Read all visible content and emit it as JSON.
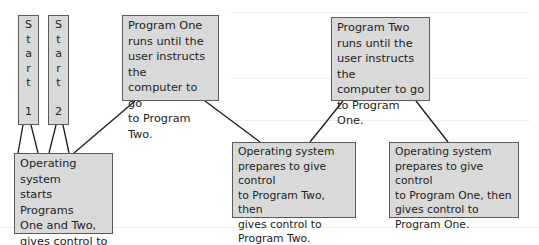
{
  "diagram": {
    "type": "flow",
    "colors": {
      "box_fill": "#d9d9d9",
      "box_border": "#5a5a5a",
      "text": "#222222",
      "connector": "#1a1a1a",
      "background": "#ffffff"
    },
    "nodes": {
      "start1": {
        "label": "S\nt\na\nr\nt\n\n1"
      },
      "start2": {
        "label": "S\nt\na\nr\nt\n\n2"
      },
      "program_one": {
        "label": "Program One\nruns until the\nuser instructs the\ncomputer to go\nto Program Two."
      },
      "program_two": {
        "label": "Program Two\nruns until the\nuser instructs the\ncomputer to go\nto Program One."
      },
      "os_start": {
        "label": "Operating system\nstarts Programs\nOne and Two,\ngives control to\nProgram One."
      },
      "os_to_two": {
        "label": "Operating system\nprepares to give control\nto Program Two, then\ngives control to\nProgram Two."
      },
      "os_to_one": {
        "label": "Operating system\nprepares to give control\nto Program One, then\ngives control to\nProgram One."
      }
    },
    "edges": [
      {
        "from": "start1",
        "to": "os_start"
      },
      {
        "from": "start2",
        "to": "os_start"
      },
      {
        "from": "program_one",
        "to": "os_start"
      },
      {
        "from": "program_one",
        "to": "os_to_two"
      },
      {
        "from": "os_to_two",
        "to": "program_two"
      },
      {
        "from": "program_two",
        "to": "os_to_one"
      }
    ]
  }
}
